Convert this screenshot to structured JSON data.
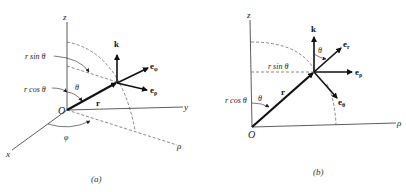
{
  "figure": {
    "panel_a": {
      "caption": "(a)",
      "axes": {
        "z": "z",
        "y": "y",
        "x": "x",
        "rho": "ρ"
      },
      "origin": "O",
      "vector_r": "r",
      "labels": {
        "r_sin_theta": "r sin θ",
        "r_cos_theta": "r cos θ",
        "theta": "θ",
        "phi": "φ"
      },
      "unit_vectors": {
        "k": "k",
        "e_phi": "e",
        "e_phi_sub": "φ",
        "e_rho": "e",
        "e_rho_sub": "ρ"
      }
    },
    "panel_b": {
      "caption": "(b)",
      "axes": {
        "z": "z",
        "rho": "ρ"
      },
      "origin": "O",
      "vector_r": "r",
      "labels": {
        "r_sin_theta": "r sin θ",
        "r_cos_theta": "r cos θ",
        "theta": "θ",
        "theta_top": "θ"
      },
      "unit_vectors": {
        "k": "k",
        "e_r": "e",
        "e_r_sub": "r",
        "e_rho": "e",
        "e_rho_sub": "ρ",
        "e_theta": "e",
        "e_theta_sub": "θ"
      }
    },
    "colors": {
      "line": "#222222",
      "dashed": "#555555",
      "background": "#ffffff"
    }
  }
}
